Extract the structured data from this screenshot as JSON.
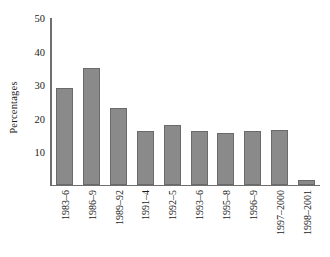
{
  "chart_data": {
    "type": "bar",
    "title": "",
    "xlabel": "",
    "ylabel": "Percentages",
    "ylim": [
      0,
      50
    ],
    "yticks": [
      10,
      20,
      30,
      40,
      50
    ],
    "grid": false,
    "legend": null,
    "bar_color": "#8a8a8a",
    "bar_edge_color": "#6a6a6a",
    "axis_color": "#6f6f6f",
    "categories": [
      "1983–6",
      "1986–9",
      "1989–92",
      "1991–4",
      "1992–5",
      "1993–6",
      "1995–8",
      "1996–9",
      "1997–2000",
      "1998–2001"
    ],
    "values": [
      29,
      35,
      23,
      16,
      18,
      16,
      15.5,
      16.2,
      16.4,
      1.5
    ]
  }
}
